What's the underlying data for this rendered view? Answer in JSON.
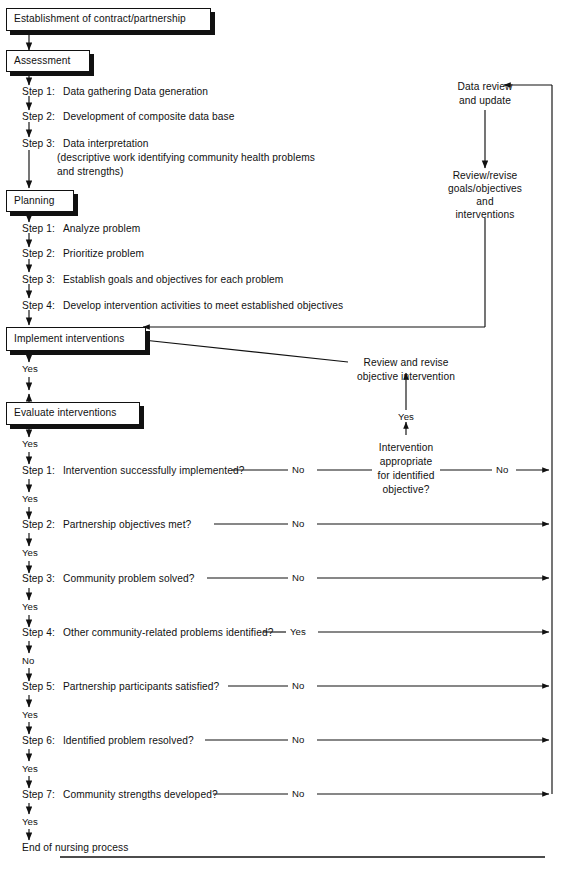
{
  "diagram": {
    "ink_color": "#111111",
    "background": "#ffffff"
  },
  "phase_boxes": [
    {
      "id": "establishment",
      "label": "Establishment of contract/partnership"
    },
    {
      "id": "assessment",
      "label": "Assessment"
    },
    {
      "id": "planning",
      "label": "Planning"
    },
    {
      "id": "implement",
      "label": "Implement interventions"
    },
    {
      "id": "evaluate",
      "label": "Evaluate interventions"
    }
  ],
  "assessment_steps": [
    {
      "num": "Step 1:",
      "text": "Data gathering    Data generation"
    },
    {
      "num": "Step 2:",
      "text": "Development of composite data base"
    },
    {
      "num": "Step 3:",
      "text": "Data interpretation"
    }
  ],
  "assessment_step3_detail": [
    "(descriptive work identifying community health problems",
    "and strengths)"
  ],
  "planning_steps": [
    {
      "num": "Step 1:",
      "text": "Analyze problem"
    },
    {
      "num": "Step 2:",
      "text": "Prioritize problem"
    },
    {
      "num": "Step 3:",
      "text": "Establish goals and objectives for each problem"
    },
    {
      "num": "Step 4:",
      "text": "Develop intervention activities to meet established objectives"
    }
  ],
  "evaluation_steps": [
    {
      "num": "Step 1:",
      "text": "Intervention successfully implemented?",
      "branch": "No"
    },
    {
      "num": "Step 2:",
      "text": "Partnership objectives met?",
      "branch": "No"
    },
    {
      "num": "Step 3:",
      "text": "Community problem solved?",
      "branch": "No"
    },
    {
      "num": "Step 4:",
      "text": "Other community-related problems identified?",
      "branch": "Yes"
    },
    {
      "num": "Step 5:",
      "text": "Partnership participants satisfied?",
      "branch": "No"
    },
    {
      "num": "Step 6:",
      "text": "Identified problem resolved?",
      "branch": "No"
    },
    {
      "num": "Step 7:",
      "text": "Community strengths developed?",
      "branch": "No"
    }
  ],
  "flow_labels": {
    "yes": "Yes",
    "no": "No",
    "implement_yes": "Yes",
    "evaluate_yes": "Yes",
    "after_step1": "Yes",
    "after_step2": "Yes",
    "after_step3": "Yes",
    "after_step4": "No",
    "after_step5": "Yes",
    "after_step6": "Yes",
    "after_step7": "Yes"
  },
  "feedback": {
    "data_review": "Data review\nand update",
    "data_review_line1": "Data review",
    "data_review_line2": "and update",
    "review_revise_goals_line1": "Review/revise",
    "review_revise_goals_line2": "goals/objectives",
    "review_revise_goals_line3": "and",
    "review_revise_goals_line4": "interventions",
    "review_revise_objective_line1": "Review and revise",
    "review_revise_objective_line2": "objective intervention",
    "decision_line1": "Intervention",
    "decision_line2": "appropriate",
    "decision_line3": "for identified",
    "decision_line4": "objective?",
    "decision_yes": "Yes",
    "decision_no": "No"
  },
  "terminal": {
    "label": "End of nursing process"
  }
}
